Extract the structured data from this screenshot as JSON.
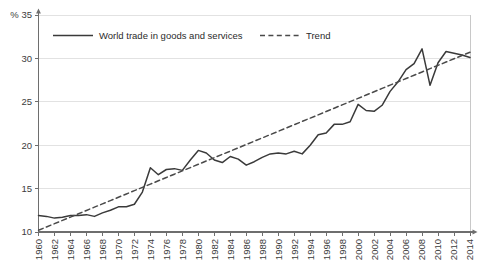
{
  "chart_data": {
    "type": "line",
    "title": "",
    "subtitle": "",
    "xlabel": "",
    "ylabel": "",
    "unit_label": "%",
    "xlim": [
      1960,
      2014
    ],
    "ylim": [
      10,
      35
    ],
    "yticks": [
      10,
      15,
      20,
      25,
      30,
      35
    ],
    "ytick_labels": [
      "10",
      "15",
      "20",
      "25",
      "30",
      "35"
    ],
    "grid": "horizontal",
    "legend_position": "top-inside",
    "x": [
      1960,
      1961,
      1962,
      1963,
      1964,
      1965,
      1966,
      1967,
      1968,
      1969,
      1970,
      1971,
      1972,
      1973,
      1974,
      1975,
      1976,
      1977,
      1978,
      1979,
      1980,
      1981,
      1982,
      1983,
      1984,
      1985,
      1986,
      1987,
      1988,
      1989,
      1990,
      1991,
      1992,
      1993,
      1994,
      1995,
      1996,
      1997,
      1998,
      1999,
      2000,
      2001,
      2002,
      2003,
      2004,
      2005,
      2006,
      2007,
      2008,
      2009,
      2010,
      2011,
      2012,
      2013,
      2014
    ],
    "xtick_values": [
      1960,
      1962,
      1964,
      1966,
      1968,
      1970,
      1972,
      1974,
      1976,
      1978,
      1980,
      1982,
      1984,
      1986,
      1988,
      1990,
      1992,
      1994,
      1996,
      1998,
      2000,
      2002,
      2004,
      2006,
      2008,
      2010,
      2012,
      2014
    ],
    "xtick_labels": [
      "1960",
      "1962",
      "1964",
      "1966",
      "1968",
      "1970",
      "1972",
      "1974",
      "1976",
      "1978",
      "1980",
      "1982",
      "1984",
      "1986",
      "1988",
      "1990",
      "1992",
      "1994",
      "1996",
      "1998",
      "2000",
      "2002",
      "2004",
      "2006",
      "2008",
      "2010",
      "2012",
      "2014"
    ],
    "series": [
      {
        "name": "World trade in goods and services",
        "style": "solid",
        "color": "#3a3a3a",
        "values": [
          11.9,
          11.8,
          11.6,
          11.7,
          11.9,
          11.9,
          12.0,
          11.8,
          12.2,
          12.5,
          12.9,
          12.9,
          13.2,
          14.6,
          17.4,
          16.6,
          17.2,
          17.3,
          17.1,
          18.3,
          19.4,
          19.1,
          18.3,
          18.0,
          18.7,
          18.4,
          17.7,
          18.1,
          18.6,
          19.0,
          19.1,
          19.0,
          19.3,
          19.0,
          20.0,
          21.2,
          21.4,
          22.4,
          22.4,
          22.7,
          24.7,
          24.0,
          23.9,
          24.6,
          26.2,
          27.3,
          28.7,
          29.4,
          31.1,
          26.9,
          29.5,
          30.8,
          30.6,
          30.4,
          30.1
        ]
      },
      {
        "name": "Trend",
        "style": "dashed",
        "color": "#4a4a4a",
        "values": [
          10.2,
          10.58,
          10.96,
          11.34,
          11.72,
          12.1,
          12.48,
          12.86,
          13.24,
          13.62,
          14.0,
          14.38,
          14.76,
          15.14,
          15.52,
          15.9,
          16.28,
          16.66,
          17.04,
          17.42,
          17.8,
          18.18,
          18.56,
          18.94,
          19.32,
          19.7,
          20.08,
          20.46,
          20.84,
          21.22,
          21.6,
          21.98,
          22.36,
          22.74,
          23.12,
          23.5,
          23.88,
          24.26,
          24.64,
          25.02,
          25.4,
          25.78,
          26.16,
          26.54,
          26.92,
          27.3,
          27.68,
          28.06,
          28.44,
          28.82,
          29.2,
          29.58,
          29.96,
          30.34,
          30.7
        ]
      }
    ],
    "legend": [
      {
        "label": "World trade in goods and services",
        "style": "solid"
      },
      {
        "label": "Trend",
        "style": "dashed"
      }
    ],
    "colors": {
      "series_line": "#3a3a3a",
      "trend_line": "#4a4a4a",
      "grid": "#e2e2e2",
      "axis": "#6e6e6e",
      "frame": "#c8c8c8",
      "text": "#3c3c3c",
      "background": "#ffffff"
    }
  }
}
